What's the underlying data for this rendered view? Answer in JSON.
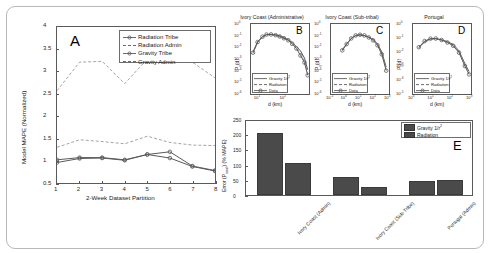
{
  "figure": {
    "background": "#ffffff",
    "line_color": "#5a5a5a",
    "bar_color": "#4a4a4a"
  },
  "panelA": {
    "letter": "A",
    "ylabel": "Model MAPE (Normalized)",
    "xlabel": "2-Week Dataset Partition",
    "yticks": [
      "0.5",
      "1",
      "1.5",
      "2",
      "2.5",
      "3",
      "3.5",
      "4"
    ],
    "xticks": [
      "1",
      "2",
      "3",
      "4",
      "5",
      "6",
      "7",
      "8"
    ],
    "legend": [
      {
        "label": "Radiation Tribe",
        "style": "solid-marker"
      },
      {
        "label": "Radiation Admin",
        "style": "dashed"
      },
      {
        "label": "Gravity Tribe",
        "style": "solid-marker"
      },
      {
        "label": "Gravity Admin",
        "style": "dashed"
      }
    ]
  },
  "panelB": {
    "letter": "B",
    "title": "Ivory Coast (Administrative)",
    "ylabel": "P(d)",
    "xlabel": "d (km)",
    "yticks": [
      "10^0",
      "10^-1",
      "10^-2",
      "10^-3",
      "10^-4",
      "10^-5",
      "10^-6"
    ],
    "xticks": [
      "10^1",
      "10^2"
    ],
    "legend": [
      "Gravity 1/r^2",
      "Radiation",
      "Data"
    ]
  },
  "panelC": {
    "letter": "C",
    "title": "Ivory Coast (Sub-tribal)",
    "ylabel": "P(d)",
    "xlabel": "d (km)",
    "yticks": [
      "10^0",
      "10^-1",
      "10^-2",
      "10^-3",
      "10^-4",
      "10^-5",
      "10^-6"
    ],
    "xticks": [
      "10^-1",
      "10^0",
      "10^1",
      "10^2",
      "10^3"
    ],
    "legend": [
      "Gravity 1/r^2",
      "Radiation",
      "Data"
    ]
  },
  "panelD": {
    "letter": "D",
    "title": "Portugal",
    "ylabel": "P(d)",
    "xlabel": "d (km)",
    "yticks": [
      "10^0",
      "10^-1",
      "10^-2",
      "10^-3",
      "10^-4",
      "10^-5"
    ],
    "xticks": [
      "10^0",
      "10^1",
      "10^2",
      "10^3"
    ],
    "legend": [
      "Gravity 1/r^2",
      "Radiation",
      "Data"
    ]
  },
  "panelE": {
    "letter": "E",
    "ylabel": "Error (P_total) (% MAPE)",
    "yticks": [
      "0",
      "50",
      "100",
      "150",
      "200",
      "250"
    ],
    "categories": [
      "Ivory Coast (Admin)",
      "Ivory Coast (Sub-Tribe)",
      "Portugal (Admin)"
    ],
    "legend": [
      "Gravity 1/r^2",
      "Radiation"
    ]
  },
  "chart_data": [
    {
      "type": "line",
      "panel": "A",
      "title": "",
      "xlabel": "2-Week Dataset Partition",
      "ylabel": "Model MAPE (Normalized)",
      "x": [
        1,
        2,
        3,
        4,
        5,
        6,
        7,
        8
      ],
      "xlim": [
        1,
        8
      ],
      "ylim": [
        0.5,
        4
      ],
      "grid": false,
      "legend_position": "top-right",
      "series": [
        {
          "name": "Radiation Tribe",
          "values": [
            0.96,
            1.05,
            1.06,
            1.01,
            1.14,
            1.06,
            0.87,
            0.77
          ]
        },
        {
          "name": "Radiation Admin",
          "values": [
            2.57,
            3.21,
            3.23,
            2.73,
            3.28,
            3.24,
            3.21,
            2.86
          ]
        },
        {
          "name": "Gravity Tribe",
          "values": [
            1.02,
            1.07,
            1.07,
            1.02,
            1.14,
            1.2,
            0.88,
            0.78
          ]
        },
        {
          "name": "Gravity Admin",
          "values": [
            1.3,
            1.47,
            1.43,
            1.38,
            1.55,
            1.41,
            1.35,
            1.34
          ]
        }
      ]
    },
    {
      "type": "line",
      "panel": "B",
      "title": "Ivory Coast (Administrative)",
      "xlabel": "d (km)",
      "ylabel": "P(d)",
      "xscale": "log",
      "yscale": "log",
      "xlim": [
        5,
        900
      ],
      "ylim": [
        1e-06,
        1
      ],
      "grid": false,
      "legend_position": "bottom-left",
      "series": [
        {
          "name": "Gravity 1/r^2",
          "x": [
            6,
            9,
            14,
            20,
            30,
            45,
            65,
            95,
            140,
            200,
            290,
            420,
            600,
            800
          ],
          "values": [
            0.004,
            0.03,
            0.08,
            0.12,
            0.13,
            0.12,
            0.1,
            0.07,
            0.045,
            0.025,
            0.012,
            0.005,
            0.0012,
            0.00012
          ]
        },
        {
          "name": "Radiation",
          "x": [
            6,
            9,
            14,
            20,
            30,
            45,
            65,
            95,
            140,
            200,
            290,
            420,
            600,
            800
          ],
          "values": [
            0.003,
            0.025,
            0.075,
            0.115,
            0.125,
            0.105,
            0.075,
            0.055,
            0.055,
            0.03,
            0.01,
            0.003,
            0.0006,
            6e-05
          ]
        },
        {
          "name": "Data",
          "x": [
            6,
            9,
            14,
            20,
            30,
            45,
            65,
            95,
            140,
            200,
            290,
            420,
            600,
            800
          ],
          "values": [
            0.0035,
            0.028,
            0.082,
            0.125,
            0.128,
            0.11,
            0.085,
            0.06,
            0.04,
            0.02,
            0.008,
            0.002,
            0.0005,
            4e-05
          ]
        }
      ]
    },
    {
      "type": "line",
      "panel": "C",
      "title": "Ivory Coast (Sub-tribal)",
      "xlabel": "d (km)",
      "ylabel": "P(d)",
      "xscale": "log",
      "yscale": "log",
      "xlim": [
        0.1,
        1000
      ],
      "ylim": [
        1e-06,
        1
      ],
      "grid": false,
      "legend_position": "bottom-left",
      "series": [
        {
          "name": "Gravity 1/r^2",
          "x": [
            0.6,
            1.2,
            2.5,
            5,
            10,
            20,
            40,
            80,
            160,
            320,
            640
          ],
          "values": [
            0.006,
            0.02,
            0.06,
            0.1,
            0.115,
            0.1,
            0.075,
            0.05,
            0.02,
            0.004,
            0.0002
          ]
        },
        {
          "name": "Radiation",
          "x": [
            0.6,
            1.2,
            2.5,
            5,
            10,
            20,
            40,
            80,
            160,
            320,
            640
          ],
          "values": [
            0.005,
            0.018,
            0.055,
            0.095,
            0.11,
            0.095,
            0.085,
            0.045,
            0.018,
            0.003,
            0.00015
          ]
        },
        {
          "name": "Data",
          "x": [
            0.6,
            1.2,
            2.5,
            5,
            10,
            20,
            40,
            80,
            160,
            320,
            640
          ],
          "values": [
            0.0055,
            0.019,
            0.058,
            0.105,
            0.12,
            0.105,
            0.07,
            0.04,
            0.015,
            0.0025,
            0.0001
          ]
        }
      ]
    },
    {
      "type": "line",
      "panel": "D",
      "title": "Portugal",
      "xlabel": "d (km)",
      "ylabel": "P(d)",
      "xscale": "log",
      "yscale": "log",
      "xlim": [
        1,
        1000
      ],
      "ylim": [
        1e-05,
        1
      ],
      "grid": false,
      "legend_position": "bottom-left",
      "series": [
        {
          "name": "Gravity 1/r^2",
          "x": [
            2,
            4,
            8,
            15,
            30,
            60,
            120,
            240,
            480,
            800
          ],
          "values": [
            0.02,
            0.055,
            0.085,
            0.09,
            0.075,
            0.055,
            0.035,
            0.012,
            0.0015,
            0.0004
          ]
        },
        {
          "name": "Radiation",
          "x": [
            2,
            4,
            8,
            15,
            30,
            60,
            120,
            240,
            480,
            800
          ],
          "values": [
            0.018,
            0.05,
            0.08,
            0.088,
            0.07,
            0.05,
            0.03,
            0.01,
            0.0012,
            0.0003
          ]
        },
        {
          "name": "Data",
          "x": [
            2,
            4,
            8,
            15,
            30,
            60,
            120,
            240,
            480,
            800
          ],
          "values": [
            0.022,
            0.06,
            0.09,
            0.092,
            0.072,
            0.048,
            0.028,
            0.009,
            0.001,
            0.00025
          ]
        }
      ]
    },
    {
      "type": "bar",
      "panel": "E",
      "title": "",
      "xlabel": "",
      "ylabel": "Error (P_total) (% MAPE)",
      "categories": [
        "Ivory Coast (Admin)",
        "Ivory Coast (Sub-Tribe)",
        "Portugal (Admin)"
      ],
      "ylim": [
        0,
        250
      ],
      "grid": false,
      "legend_position": "top-right",
      "series": [
        {
          "name": "Gravity 1/r^2",
          "values": [
            205,
            58,
            45
          ]
        },
        {
          "name": "Radiation",
          "values": [
            105,
            25,
            48
          ]
        }
      ]
    }
  ]
}
